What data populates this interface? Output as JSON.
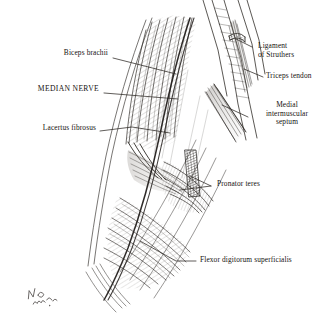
{
  "figure": {
    "medium": "pen-and-ink anatomical illustration",
    "background_color": "#ffffff",
    "ink_color": "#15120f",
    "leader_line_color": "#2b2723",
    "artist_signature": "illegible handwritten monogram, lower left"
  },
  "labels": {
    "biceps_brachii": "Biceps brachii",
    "median_nerve": "MEDIAN NERVE",
    "lacertus_fibrosus": "Lacertus fibrosus",
    "ligament_of_struthers_l1": "Ligament",
    "ligament_of_struthers_l2": "of Struthers",
    "triceps_tendon": "Triceps tendon",
    "medial_septum_l1": "Medial",
    "medial_septum_l2": "intermuscular",
    "medial_septum_l3": "septum",
    "pronator_teres": "Pronator teres",
    "flexor_digitorum_superficialis": "Flexor digitorum superficialis"
  }
}
